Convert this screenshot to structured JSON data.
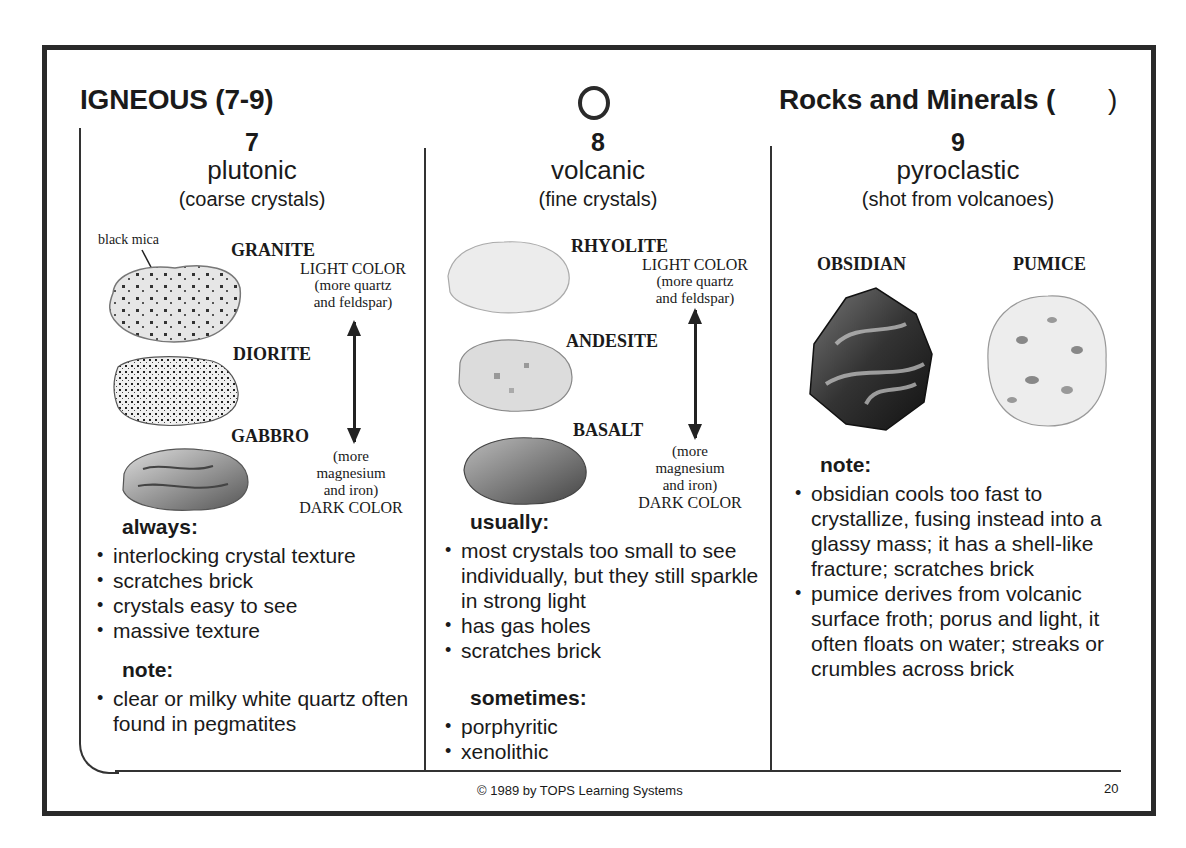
{
  "header": {
    "title": "IGNEOUS (7-9)",
    "subject": "Rocks and Minerals (",
    "subject_close": ")",
    "circle_icon": "hollow-circle"
  },
  "columns": [
    {
      "number": "7",
      "type": "plutonic",
      "subtitle": "(coarse crystals)",
      "callout": "black mica",
      "rocks": [
        "GRANITE",
        "DIORITE",
        "GABBRO"
      ],
      "light_label": "LIGHT COLOR",
      "light_note_1": "(more quartz",
      "light_note_2": "and feldspar)",
      "dark_note_1": "(more",
      "dark_note_2": "magnesium",
      "dark_note_3": "and iron)",
      "dark_label": "DARK COLOR",
      "heading_1": "always:",
      "bullets_1": [
        "interlocking crystal texture",
        "scratches brick",
        "crystals easy to see",
        "massive texture"
      ],
      "heading_2": "note:",
      "bullets_2": [
        "clear or milky white quartz often found in pegmatites"
      ]
    },
    {
      "number": "8",
      "type": "volcanic",
      "subtitle": "(fine crystals)",
      "rocks": [
        "RHYOLITE",
        "ANDESITE",
        "BASALT"
      ],
      "light_label": "LIGHT COLOR",
      "light_note_1": "(more quartz",
      "light_note_2": "and feldspar)",
      "dark_note_1": "(more",
      "dark_note_2": "magnesium",
      "dark_note_3": "and iron)",
      "dark_label": "DARK COLOR",
      "heading_1": "usually:",
      "bullets_1": [
        "most crystals too small to see individually, but they still  sparkle in strong light",
        "has gas holes",
        "scratches brick"
      ],
      "heading_2": "sometimes:",
      "bullets_2": [
        "porphyritic",
        "xenolithic"
      ]
    },
    {
      "number": "9",
      "type": "pyroclastic",
      "subtitle": "(shot from volcanoes)",
      "rocks": [
        "OBSIDIAN",
        "PUMICE"
      ],
      "heading_1": "note:",
      "bullets_1": [
        "obsidian cools too fast to crystallize, fusing instead into a glassy mass; it has a shell-like fracture; scratches brick",
        "pumice derives from volcanic surface froth; porus and light, it often floats on water; streaks or crumbles across brick"
      ]
    }
  ],
  "footer": {
    "copyright": "© 1989 by TOPS Learning Systems",
    "page_number": "20"
  }
}
